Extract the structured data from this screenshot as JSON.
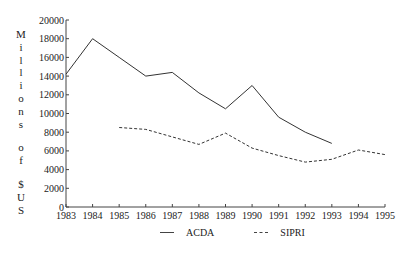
{
  "chart_data": {
    "type": "line",
    "title": "",
    "xlabel": "",
    "ylabel": "Millions of $US",
    "ylim": [
      0,
      20000
    ],
    "yticks": [
      0,
      2000,
      4000,
      6000,
      8000,
      10000,
      12000,
      14000,
      16000,
      18000,
      20000
    ],
    "x": [
      1983,
      1984,
      1985,
      1986,
      1987,
      1988,
      1989,
      1990,
      1991,
      1992,
      1993,
      1994,
      1995
    ],
    "series": [
      {
        "name": "ACDA",
        "style": "solid",
        "values": [
          14200,
          18000,
          16000,
          14000,
          14400,
          12200,
          10500,
          13000,
          9600,
          8000,
          6800,
          null,
          null
        ]
      },
      {
        "name": "SIPRI",
        "style": "dashed",
        "values": [
          null,
          null,
          8500,
          8300,
          7500,
          6700,
          7900,
          6300,
          5500,
          4800,
          5100,
          6100,
          5600
        ]
      }
    ],
    "grid": false,
    "legend_position": "bottom"
  },
  "legend": {
    "items": [
      {
        "label": "ACDA",
        "style": "solid"
      },
      {
        "label": "SIPRI",
        "style": "dashed"
      }
    ]
  }
}
